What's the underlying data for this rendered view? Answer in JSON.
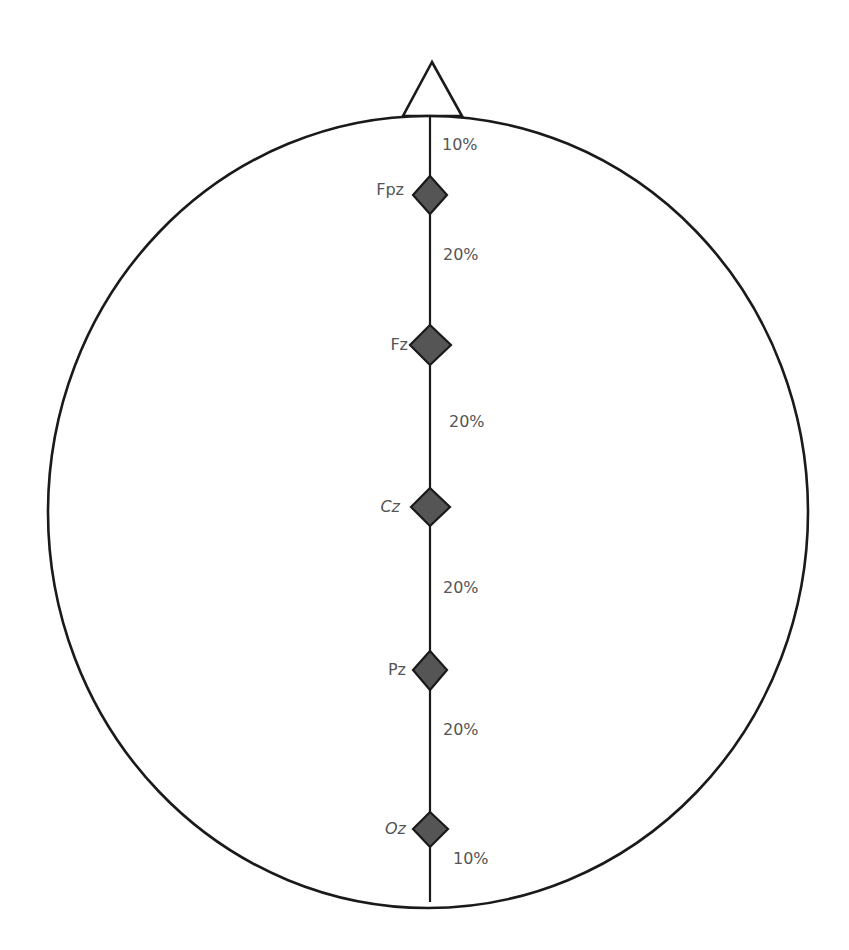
{
  "diagram": {
    "landmarks": {
      "nose": "nasion (nose, top)",
      "inion": "inion (back of head, bottom)"
    },
    "electrodes": [
      {
        "id": "Fpz",
        "label": "Fpz",
        "y": 195
      },
      {
        "id": "Fz",
        "label": "Fz",
        "y": 345
      },
      {
        "id": "Cz",
        "label": "Cz",
        "y": 507
      },
      {
        "id": "Pz",
        "label": "Pz",
        "y": 670
      },
      {
        "id": "Oz",
        "label": "Oz",
        "y": 829
      }
    ],
    "intervals": [
      {
        "label": "10%",
        "between": "nasion-Fpz"
      },
      {
        "label": "20%",
        "between": "Fpz-Fz"
      },
      {
        "label": "20%",
        "between": "Fz-Cz"
      },
      {
        "label": "20%",
        "between": "Cz-Pz"
      },
      {
        "label": "20%",
        "between": "Pz-Oz"
      },
      {
        "label": "10%",
        "between": "Oz-inion"
      }
    ],
    "colors": {
      "outline": "#1a1a1a",
      "electrode_fill": "#555555",
      "text": "#555555",
      "background": "#ffffff"
    }
  }
}
